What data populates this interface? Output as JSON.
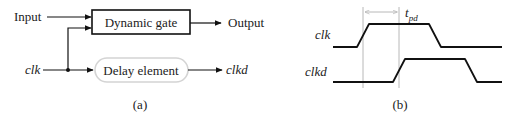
{
  "panel_a": {
    "caption": "(a)",
    "input_label": "Input",
    "gate_label": "Dynamic gate",
    "output_label": "Output",
    "clk_label": "clk",
    "delay_label": "Delay element",
    "clkd_label": "clkd"
  },
  "panel_b": {
    "caption": "(b)",
    "clk_label": "clk",
    "clkd_label": "clkd",
    "tpd_main": "t",
    "tpd_sub": "pd"
  },
  "colors": {
    "line": "#111111",
    "guide": "#b8b8b8",
    "pill_border": "#d4d4d4"
  }
}
